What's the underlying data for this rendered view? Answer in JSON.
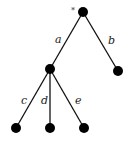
{
  "tree": {
    "root_marker": "*",
    "nodes": [
      {
        "id": "root",
        "x": 83,
        "y": 12
      },
      {
        "id": "mid",
        "x": 50,
        "y": 69
      },
      {
        "id": "leaf-b",
        "x": 118,
        "y": 71
      },
      {
        "id": "leaf-c",
        "x": 16,
        "y": 128
      },
      {
        "id": "leaf-d",
        "x": 50,
        "y": 128
      },
      {
        "id": "leaf-e",
        "x": 84,
        "y": 128
      }
    ],
    "edges": [
      {
        "from": "root",
        "to": "mid",
        "label": "a"
      },
      {
        "from": "root",
        "to": "leaf-b",
        "label": "b"
      },
      {
        "from": "mid",
        "to": "leaf-c",
        "label": "c"
      },
      {
        "from": "mid",
        "to": "leaf-d",
        "label": "d"
      },
      {
        "from": "mid",
        "to": "leaf-e",
        "label": "e"
      }
    ],
    "labels": {
      "a": "a",
      "b": "b",
      "c": "c",
      "d": "d",
      "e": "e"
    }
  }
}
